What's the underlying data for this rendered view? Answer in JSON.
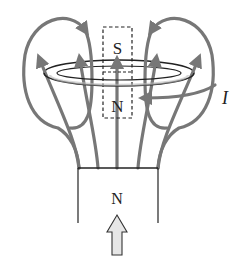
{
  "figure": {
    "magnet": {
      "pole_label": "N",
      "motion_arrow": "up-arrow"
    },
    "equivalent_magnet": {
      "top_label": "S",
      "bottom_label": "N",
      "style": "dashed"
    },
    "ring": {
      "current_label": "I"
    },
    "colors": {
      "field_line": "#777777",
      "outline": "#222222",
      "arrow_fill": "#e6e6e6"
    }
  }
}
